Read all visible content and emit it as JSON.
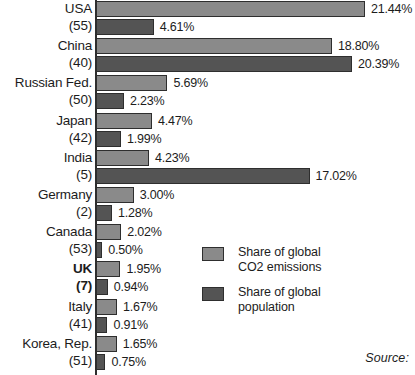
{
  "chart_data": {
    "type": "bar",
    "orientation": "horizontal",
    "title": "",
    "xlabel": "",
    "ylabel": "",
    "xlim": [
      0,
      25
    ],
    "grid": false,
    "categories": [
      "USA",
      "China",
      "Russian Fed.",
      "Japan",
      "India",
      "Germany",
      "Canada",
      "UK",
      "Italy",
      "Korea, Rep."
    ],
    "category_ranks": [
      "(55)",
      "(40)",
      "(50)",
      "(42)",
      "(5)",
      "(2)",
      "(53)",
      "(7)",
      "(41)",
      "(51)"
    ],
    "series": [
      {
        "name": "Share of global CO2 emissions",
        "color": "#8a8a8a",
        "values": [
          21.44,
          18.8,
          5.69,
          4.47,
          4.23,
          3.0,
          2.02,
          1.95,
          1.67,
          1.65
        ],
        "labels": [
          "21.44%",
          "18.80%",
          "5.69%",
          "4.47%",
          "4.23%",
          "3.00%",
          "2.02%",
          "1.95%",
          "1.67%",
          "1.65%"
        ]
      },
      {
        "name": "Share of global population",
        "color": "#545454",
        "values": [
          4.61,
          20.39,
          2.23,
          1.99,
          17.02,
          1.28,
          0.5,
          0.94,
          0.91,
          0.75
        ],
        "labels": [
          "4.61%",
          "20.39%",
          "2.23%",
          "1.99%",
          "17.02%",
          "1.28%",
          "0.50%",
          "0.94%",
          "0.91%",
          "0.75%"
        ]
      }
    ],
    "legend_position": "center-right",
    "highlighted_category": "UK"
  },
  "rows": [
    {
      "name": "USA",
      "rank": "(55)",
      "co2": 21.44,
      "co2_label": "21.44%",
      "pop": 4.61,
      "pop_label": "4.61%",
      "bold": false
    },
    {
      "name": "China",
      "rank": "(40)",
      "co2": 18.8,
      "co2_label": "18.80%",
      "pop": 20.39,
      "pop_label": "20.39%",
      "bold": false
    },
    {
      "name": "Russian Fed.",
      "rank": "(50)",
      "co2": 5.69,
      "co2_label": "5.69%",
      "pop": 2.23,
      "pop_label": "2.23%",
      "bold": false
    },
    {
      "name": "Japan",
      "rank": "(42)",
      "co2": 4.47,
      "co2_label": "4.47%",
      "pop": 1.99,
      "pop_label": "1.99%",
      "bold": false
    },
    {
      "name": "India",
      "rank": "(5)",
      "co2": 4.23,
      "co2_label": "4.23%",
      "pop": 17.02,
      "pop_label": "17.02%",
      "bold": false
    },
    {
      "name": "Germany",
      "rank": "(2)",
      "co2": 3.0,
      "co2_label": "3.00%",
      "pop": 1.28,
      "pop_label": "1.28%",
      "bold": false
    },
    {
      "name": "Canada",
      "rank": "(53)",
      "co2": 2.02,
      "co2_label": "2.02%",
      "pop": 0.5,
      "pop_label": "0.50%",
      "bold": false
    },
    {
      "name": "UK",
      "rank": "(7)",
      "co2": 1.95,
      "co2_label": "1.95%",
      "pop": 0.94,
      "pop_label": "0.94%",
      "bold": true
    },
    {
      "name": "Italy",
      "rank": "(41)",
      "co2": 1.67,
      "co2_label": "1.67%",
      "pop": 0.91,
      "pop_label": "0.91%",
      "bold": false
    },
    {
      "name": "Korea, Rep.",
      "rank": "(51)",
      "co2": 1.65,
      "co2_label": "1.65%",
      "pop": 0.75,
      "pop_label": "0.75%",
      "bold": false
    }
  ],
  "legend": {
    "items": [
      {
        "label_line1": "Share of global",
        "label_line2": "CO2 emissions",
        "color": "#8a8a8a"
      },
      {
        "label_line1": "Share of global",
        "label_line2": "population",
        "color": "#545454"
      }
    ]
  },
  "source": {
    "text": "Source:"
  },
  "scale": {
    "px_per_percent": 12.55,
    "axis_x": 96,
    "row_height": 37.2
  }
}
